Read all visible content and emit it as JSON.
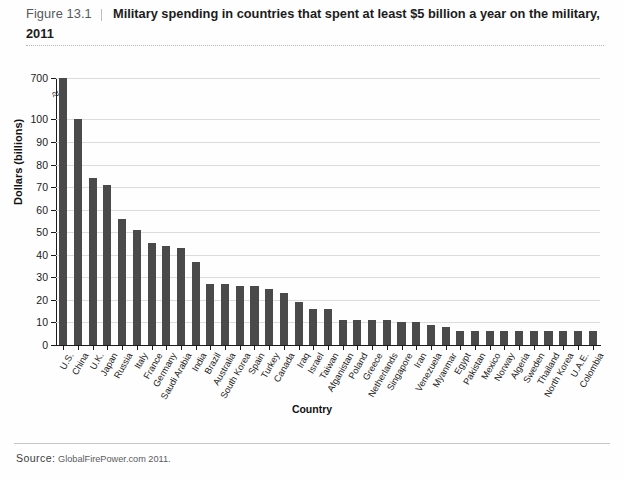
{
  "figure": {
    "number": "Figure 13.1",
    "title": "Military spending in countries that spent at least $5 billion a year on the military, 2011",
    "source_label": "Source:",
    "source_text": "GlobalFirePower.com 2011.",
    "axis_break_glyph": "≈"
  },
  "chart_data": {
    "type": "bar",
    "title": "Military spending in countries that spent at least $5 billion a year on the military, 2011",
    "xlabel": "Country",
    "ylabel": "Dollars (billions)",
    "ylim": [
      0,
      700
    ],
    "y_axis_break": true,
    "y_axis_note": "Axis is broken between 100 and 700",
    "grid": true,
    "legend": "none",
    "ytick_labels": [
      "0",
      "10",
      "20",
      "30",
      "40",
      "50",
      "60",
      "70",
      "80",
      "90",
      "100",
      "700"
    ],
    "ytick_values": [
      0,
      10,
      20,
      30,
      40,
      50,
      60,
      70,
      80,
      90,
      100,
      700
    ],
    "categories": [
      "U.S.",
      "China",
      "U.K.",
      "Japan",
      "Russia",
      "Italy",
      "France",
      "Germany",
      "Saudi Arabia",
      "India",
      "Brazil",
      "Australia",
      "South Korea",
      "Spain",
      "Turkey",
      "Canada",
      "Iraq",
      "Israel",
      "Taiwan",
      "Afganistan",
      "Poland",
      "Greece",
      "Netherlands",
      "Singapore",
      "Iran",
      "Venezuela",
      "Myanmar",
      "Egypt",
      "Pakistan",
      "Mexico",
      "Norway",
      "Algeria",
      "Sweden",
      "Thailand",
      "North Korea",
      "U.A.E.",
      "Colombia"
    ],
    "values": [
      700,
      100,
      74,
      71,
      56,
      51,
      45,
      44,
      43,
      37,
      27,
      27,
      26,
      26,
      25,
      23,
      19,
      16,
      16,
      11,
      11,
      11,
      11,
      10,
      10,
      9,
      8,
      6,
      6,
      6,
      6,
      6,
      6,
      6,
      6,
      6,
      6
    ]
  }
}
